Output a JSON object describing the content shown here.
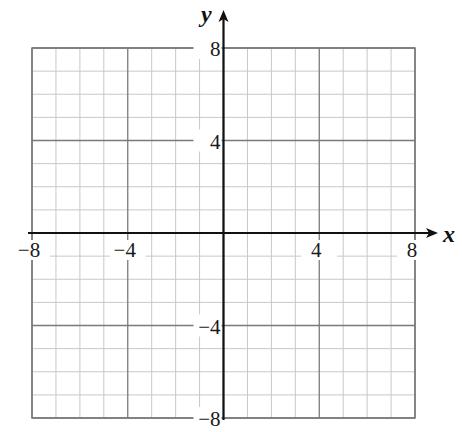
{
  "chart_data": {
    "type": "scatter",
    "title": "",
    "xlabel": "x",
    "ylabel": "y",
    "xlim": [
      -8,
      8
    ],
    "ylim": [
      -8,
      8
    ],
    "grid": true,
    "grid_minor_step": 1,
    "grid_major_step": 4,
    "x_tick_labels": [
      "−8",
      "−4",
      "4",
      "8"
    ],
    "x_ticks": [
      -8,
      -4,
      4,
      8
    ],
    "y_tick_labels": [
      "8",
      "4",
      "−4",
      "−8"
    ],
    "y_ticks": [
      8,
      4,
      -4,
      -8
    ],
    "series": [],
    "legend": null
  },
  "colors": {
    "minor_grid": "#c8c8c8",
    "major_grid": "#7a7a7a",
    "axis": "#111111",
    "background": "#ffffff"
  }
}
